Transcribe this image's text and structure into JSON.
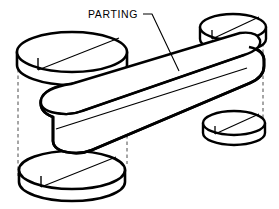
{
  "figure": {
    "domain": "Diagram",
    "background_color": "#ffffff",
    "line_color": "#000000",
    "hidden_line_color": "#555555",
    "fill_color": "#ffffff"
  },
  "annotations": [
    {
      "id": "parting-label",
      "text": "PARTING",
      "x": 88,
      "y": 18,
      "leader": {
        "from_x": 143,
        "from_y": 14,
        "elbow_x": 152,
        "elbow_y": 14,
        "to_x": 179,
        "to_y": 71
      }
    }
  ],
  "parts": [
    {
      "id": "disc-upper-left",
      "name": "Upper left cylindrical boss",
      "cx": 72,
      "cy": 52,
      "rx": 56,
      "ry": 20,
      "height": 22,
      "has_parting_seam": true
    },
    {
      "id": "disc-upper-right",
      "name": "Upper right cylindrical boss",
      "cx": 233,
      "cy": 27,
      "rx": 33,
      "ry": 13,
      "height": 16,
      "has_parting_seam": true
    },
    {
      "id": "disc-lower-left",
      "name": "Lower left cylindrical boss",
      "cx": 72,
      "cy": 170,
      "rx": 53,
      "ry": 19,
      "height": 22,
      "has_parting_seam": true
    },
    {
      "id": "disc-lower-right",
      "name": "Lower right cylindrical boss",
      "cx": 234,
      "cy": 123,
      "rx": 31,
      "ry": 12,
      "height": 14,
      "has_parting_seam": true
    },
    {
      "id": "link-bar",
      "name": "Central forged link bar",
      "left_end_x": 41,
      "left_end_y": 113,
      "right_end_x": 248,
      "right_end_y": 68,
      "has_parting_seam": true
    }
  ],
  "construction_lines": {
    "vertical_projections": [
      {
        "id": "proj-left-outer",
        "x": 18,
        "y1": 56,
        "y2": 176
      },
      {
        "id": "proj-left-inner",
        "x": 127,
        "y1": 57,
        "y2": 164
      },
      {
        "id": "proj-right-outer",
        "x": 204,
        "y1": 32,
        "y2": 78
      },
      {
        "id": "proj-right-inner",
        "x": 263,
        "y1": 30,
        "y2": 128
      },
      {
        "id": "proj-bar-center",
        "x": 104,
        "y1": 72,
        "y2": 114
      }
    ],
    "hidden_arcs": [
      {
        "id": "hidden-arc-left",
        "note": "hidden elliptical end of bar boss, left"
      },
      {
        "id": "hidden-arc-right",
        "note": "hidden elliptical end of bar boss, right"
      }
    ]
  }
}
